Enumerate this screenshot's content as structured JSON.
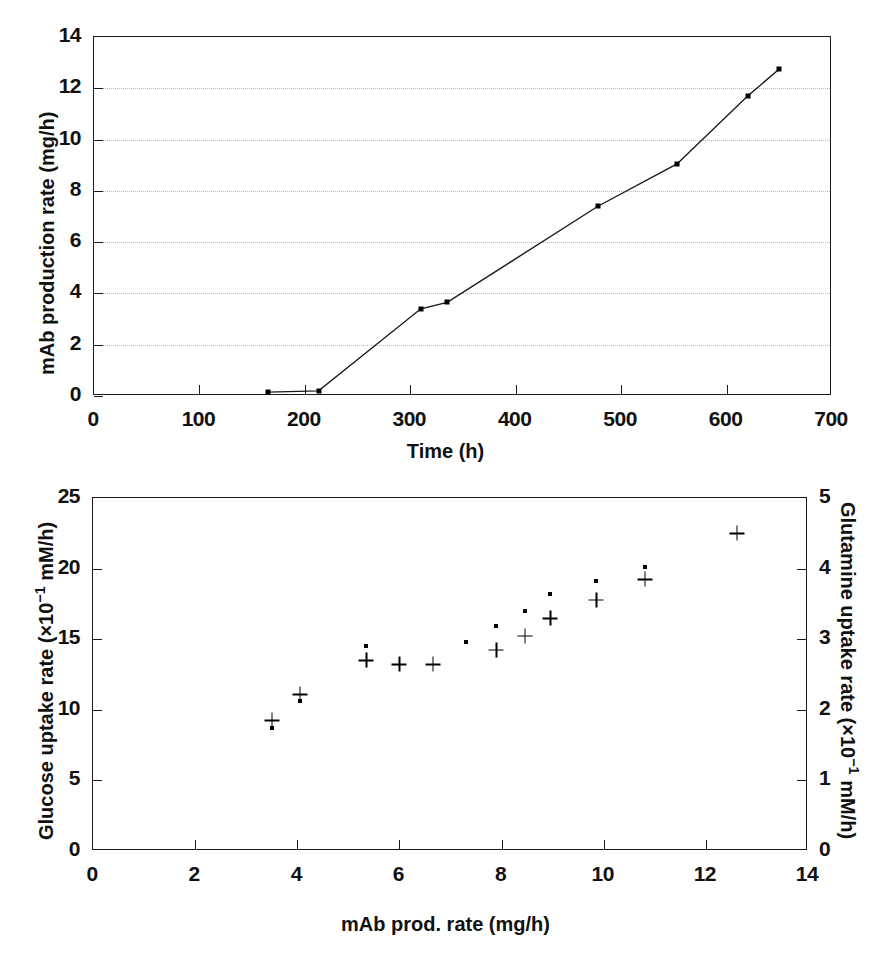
{
  "figure": {
    "panels": [
      "top-line-chart",
      "bottom-scatter-chart"
    ]
  },
  "chart_data": [
    {
      "id": "top",
      "type": "line",
      "title": "",
      "xlabel": "Time (h)",
      "ylabel": "mAb production rate (mg/h)",
      "xlim": [
        0,
        700
      ],
      "ylim": [
        0,
        14
      ],
      "xticks": [
        0,
        100,
        200,
        300,
        400,
        500,
        600,
        700
      ],
      "yticks": [
        0,
        2,
        4,
        6,
        8,
        10,
        12,
        14
      ],
      "grid": "horizontal-dotted",
      "legend": "none",
      "marker": "filled-square",
      "series": [
        {
          "name": "mAb production rate",
          "x": [
            165,
            213,
            310,
            335,
            478,
            553,
            620,
            650
          ],
          "y": [
            0.15,
            0.2,
            3.4,
            3.65,
            7.4,
            9.05,
            11.7,
            12.75
          ]
        }
      ]
    },
    {
      "id": "bottom",
      "type": "scatter",
      "title": "",
      "xlabel": "mAb prod. rate (mg/h)",
      "ylabel": "Glucose uptake rate (×10⁻¹ mM/h)",
      "ylabel_right": "Glutamine uptake rate (×10⁻¹ mM/h)",
      "xlim": [
        0,
        14
      ],
      "ylim": [
        0,
        25
      ],
      "ylim_right": [
        0,
        5
      ],
      "xticks": [
        0,
        2,
        4,
        6,
        8,
        10,
        12,
        14
      ],
      "yticks": [
        0,
        5,
        10,
        15,
        20,
        25
      ],
      "yticks_right": [
        0,
        1,
        2,
        3,
        4,
        5
      ],
      "grid": "none",
      "legend": "none",
      "series": [
        {
          "name": "Glucose uptake rate",
          "marker": "dot",
          "axis": "left",
          "x": [
            3.5,
            4.05,
            5.35,
            7.3,
            7.9,
            8.45,
            8.95,
            9.85,
            10.8
          ],
          "y": [
            8.7,
            10.6,
            14.5,
            14.8,
            15.9,
            17.0,
            18.2,
            19.1,
            20.1
          ]
        },
        {
          "name": "Glutamine uptake rate",
          "marker": "plus",
          "axis": "right",
          "x": [
            3.5,
            4.05,
            5.35,
            6.0,
            6.65,
            7.9,
            8.45,
            8.95,
            9.85,
            10.8,
            12.6
          ],
          "y": [
            1.85,
            2.22,
            2.7,
            2.65,
            2.65,
            2.85,
            3.05,
            3.3,
            3.56,
            3.85,
            4.5
          ]
        }
      ]
    }
  ],
  "top_chart": {
    "ylabel": "mAb production rate (mg/h)",
    "xlabel": "Time (h)",
    "xticks": [
      "0",
      "100",
      "200",
      "300",
      "400",
      "500",
      "600",
      "700"
    ],
    "yticks": [
      "0",
      "2",
      "4",
      "6",
      "8",
      "10",
      "12",
      "14"
    ]
  },
  "bottom_chart": {
    "ylabel_left_a": "Glucose uptake rate (×10",
    "ylabel_left_exp": "−1",
    "ylabel_left_b": " mM/h)",
    "ylabel_right_a": "Glutamine uptake rate (×10",
    "ylabel_right_exp": "−1",
    "ylabel_right_b": " mM/h)",
    "xlabel": "mAb prod. rate (mg/h)",
    "xticks": [
      "0",
      "2",
      "4",
      "6",
      "8",
      "10",
      "12",
      "14"
    ],
    "yticks_left": [
      "0",
      "5",
      "10",
      "15",
      "20",
      "25"
    ],
    "yticks_right": [
      "0",
      "1",
      "2",
      "3",
      "4",
      "5"
    ]
  },
  "colors": {
    "axis": "#1a1a1a",
    "grid": "#b8b8b8",
    "marker": "#000000",
    "background": "#ffffff"
  }
}
